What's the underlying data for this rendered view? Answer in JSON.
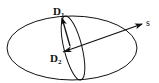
{
  "diagram": {
    "labels": {
      "d1": "D",
      "d1_sub": "1",
      "d2": "D",
      "d2_sub": "2",
      "s": "s"
    },
    "shapes": {
      "outer_ellipse": {
        "cx": 72,
        "cy": 48,
        "rx": 65,
        "ry": 32
      },
      "inner_ellipse": {
        "cx": 73,
        "cy": 48,
        "rx": 10,
        "ry": 33,
        "rotate": -15
      }
    },
    "arrows": [
      {
        "name": "vector-s",
        "from": [
          63,
          52
        ],
        "to": [
          143,
          24
        ]
      },
      {
        "name": "vector-d2-to-d1",
        "from": [
          70,
          46
        ],
        "to": [
          62,
          17
        ]
      }
    ],
    "colors": {
      "stroke": "#111111",
      "background": "#ffffff"
    }
  }
}
